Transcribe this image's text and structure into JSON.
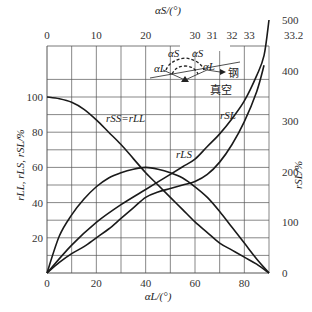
{
  "chart_data": {
    "type": "line",
    "title": "",
    "xlabel": "αL/(°)",
    "x_top_label": "αS/(°)",
    "ylabel_left": "rLL, rLS, rSL/%",
    "ylabel_right": "rSL/%",
    "xlim": [
      0,
      90
    ],
    "ylim_left": [
      0,
      110
    ],
    "ylim_right": [
      0,
      500
    ],
    "grid": true,
    "x_ticks": [
      0,
      20,
      40,
      60,
      80
    ],
    "x_top_ticks": [
      {
        "label": "0",
        "alphaL": 0
      },
      {
        "label": "10",
        "alphaL": 20
      },
      {
        "label": "20",
        "alphaL": 40
      },
      {
        "label": "30",
        "alphaL": 60
      },
      {
        "label": "31",
        "alphaL": 67
      },
      {
        "label": "32",
        "alphaL": 75
      },
      {
        "label": "33",
        "alphaL": 82
      },
      {
        "label": "33.2",
        "alphaL": 90
      }
    ],
    "y_left_ticks": [
      20,
      40,
      60,
      80,
      100
    ],
    "y_right_ticks": [
      0,
      100,
      200,
      300,
      400,
      500
    ],
    "series": [
      {
        "name": "rSS=rLL",
        "axis": "left",
        "x": [
          0,
          5,
          10,
          15,
          20,
          25,
          30,
          35,
          40,
          45,
          50,
          55,
          60,
          65,
          70,
          75,
          80,
          85,
          90
        ],
        "y": [
          100,
          99,
          97,
          93,
          87,
          80,
          73,
          65,
          57,
          50,
          43,
          36,
          29,
          23,
          17,
          13,
          9,
          5,
          0
        ]
      },
      {
        "name": "rLS",
        "axis": "left",
        "x": [
          0,
          5,
          10,
          15,
          20,
          25,
          30,
          35,
          40,
          45,
          50,
          55,
          60,
          65,
          70,
          75,
          80,
          85,
          90
        ],
        "y": [
          0,
          21,
          33,
          42,
          49,
          54,
          57,
          59,
          60,
          59,
          57,
          54,
          49,
          43,
          35,
          26,
          17,
          8,
          0
        ]
      },
      {
        "name": "rSL",
        "axis": "right",
        "x": [
          0,
          10,
          20,
          30,
          40,
          45,
          50,
          55,
          60,
          65,
          70,
          75,
          80,
          85,
          88,
          90
        ],
        "y": [
          0,
          55,
          100,
          135,
          165,
          180,
          195,
          210,
          225,
          250,
          275,
          305,
          340,
          390,
          430,
          500
        ]
      },
      {
        "name": "rSL (lower branch)",
        "axis": "left",
        "x": [
          0,
          5,
          10,
          15,
          20,
          25,
          30,
          35,
          40,
          45,
          50,
          55,
          60,
          65,
          70,
          75,
          80,
          85,
          88
        ],
        "y": [
          0,
          6,
          11,
          15,
          20,
          25,
          31,
          37,
          43,
          46,
          48,
          50,
          52,
          56,
          63,
          73,
          86,
          103,
          118
        ]
      }
    ],
    "annotations": [
      "rSS=rLL",
      "rLS",
      "rSL",
      "αS",
      "αS",
      "αL",
      "αL",
      "钢",
      "真空"
    ]
  },
  "labels": {
    "xlabel": "αL/(°)",
    "x_top_label": "αS/(°)",
    "ylabel_left": "rLL, rLS, rSL/%",
    "ylabel_right": "rSL/%",
    "curve_rss_rll": "rSS=rLL",
    "curve_rls": "rLS",
    "curve_rsl": "rSL",
    "inset_steel": "钢",
    "inset_vacuum": "真空",
    "inset_alpha_s": "αS",
    "inset_alpha_l": "αL"
  }
}
